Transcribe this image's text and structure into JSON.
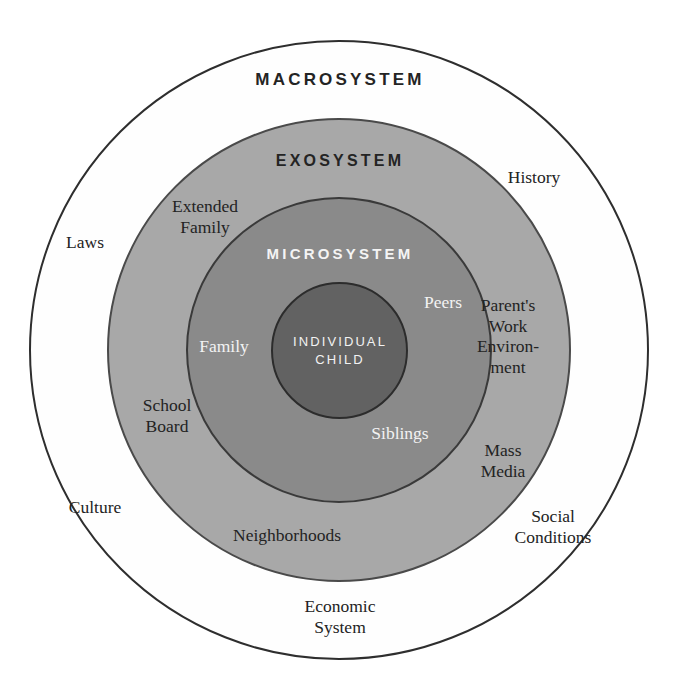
{
  "diagram": {
    "type": "concentric-circles",
    "tiers": [
      {
        "id": "macrosystem",
        "title": "MACROSYSTEM",
        "fill": "#fefefe",
        "stroke": "#2e2e2e",
        "title_color": "#242424",
        "items": [
          {
            "id": "history",
            "label": "History"
          },
          {
            "id": "laws",
            "label": "Laws"
          },
          {
            "id": "culture",
            "label": "Culture"
          },
          {
            "id": "social-conditions",
            "label": "Social\nConditions"
          },
          {
            "id": "economic-system",
            "label": "Economic\nSystem"
          }
        ]
      },
      {
        "id": "exosystem",
        "title": "EXOSYSTEM",
        "fill": "#a8a8a8",
        "stroke": "#4a4a4a",
        "title_color": "#242424",
        "items": [
          {
            "id": "extended-family",
            "label": "Extended\nFamily"
          },
          {
            "id": "school-board",
            "label": "School\nBoard"
          },
          {
            "id": "neighborhoods",
            "label": "Neighborhoods"
          },
          {
            "id": "parents-work-environment",
            "label": "Parent's\nWork\nEnviron-\nment"
          },
          {
            "id": "mass-media",
            "label": "Mass\nMedia"
          }
        ]
      },
      {
        "id": "microsystem",
        "title": "MICROSYSTEM",
        "fill": "#8a8a8a",
        "stroke": "#3a3a3a",
        "title_color": "#f4f4f4",
        "items": [
          {
            "id": "family",
            "label": "Family"
          },
          {
            "id": "peers",
            "label": "Peers"
          },
          {
            "id": "siblings",
            "label": "Siblings"
          }
        ]
      },
      {
        "id": "individual-child",
        "title": "INDIVIDUAL\nCHILD",
        "fill": "#626262",
        "stroke": "#2c2c2c",
        "title_color": "#f2f2f2",
        "items": []
      }
    ]
  }
}
